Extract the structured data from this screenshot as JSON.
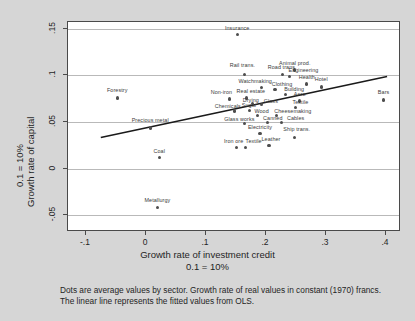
{
  "figure": {
    "background_color": "#d6d6d6",
    "plot_background_color": "#ffffff",
    "axis_color": "#4a4a4a",
    "grid_color": "#b9b9b9",
    "dot_color": "#4d4d4d",
    "fit_line_color": "#1a1a1a"
  },
  "caption": {
    "line1": "Dots are average values by sector. Growth rate of real values in constant (1970) francs.",
    "line2": "The linear line represents the fitted values from OLS."
  },
  "chart_data": {
    "type": "scatter",
    "title": "",
    "xlabel": "Growth rate of investment credit",
    "xlabel_sub": "0.1 = 10%",
    "ylabel": "Growth rate of capital",
    "ylabel_sub": "0.1 = 10%",
    "xlim": [
      -0.13,
      0.425
    ],
    "ylim": [
      -0.068,
      0.157
    ],
    "grid": true,
    "legend": "none",
    "xticks": [
      -0.1,
      0,
      0.1,
      0.2,
      0.3,
      0.4
    ],
    "xtick_labels": [
      "-.1",
      "0",
      ".1",
      ".2",
      ".3",
      ".4"
    ],
    "yticks": [
      -0.05,
      0,
      0.05,
      0.1,
      0.15
    ],
    "ytick_labels": [
      "-.05",
      "0",
      ".05",
      ".1",
      ".15"
    ],
    "fit_line": {
      "label": "OLS fitted values",
      "x_start": -0.075,
      "y_start": 0.032,
      "x_end": 0.405,
      "y_end": 0.098
    },
    "points": [
      {
        "label": "Insurance",
        "x": 0.152,
        "y": 0.1435,
        "label_dx": 0,
        "label_dy": -6
      },
      {
        "label": "Animal prod.",
        "x": 0.248,
        "y": 0.1055,
        "label_dx": 0,
        "label_dy": -6
      },
      {
        "label": "Rail trans.",
        "x": 0.164,
        "y": 0.1005,
        "label_dx": -2,
        "label_dy": -9
      },
      {
        "label": "Road trans.",
        "x": 0.227,
        "y": 0.1005,
        "label_dx": 0,
        "label_dy": -7
      },
      {
        "label": "Engineering",
        "x": 0.239,
        "y": 0.0985,
        "label_dx": 14,
        "label_dy": -6
      },
      {
        "label": "Health",
        "x": 0.268,
        "y": 0.0905,
        "label_dx": 0,
        "label_dy": -6
      },
      {
        "label": "Hotel",
        "x": 0.292,
        "y": 0.0875,
        "label_dx": 0,
        "label_dy": -7
      },
      {
        "label": "Watchmaking",
        "x": 0.192,
        "y": 0.0865,
        "label_dx": -6,
        "label_dy": -6
      },
      {
        "label": "Clothing",
        "x": 0.215,
        "y": 0.0845,
        "label_dx": 7,
        "label_dy": -5
      },
      {
        "label": "Building",
        "x": 0.232,
        "y": 0.0795,
        "label_dx": 9,
        "label_dy": -4
      },
      {
        "label": "Forestry",
        "x": -0.048,
        "y": 0.0755,
        "label_dx": 0,
        "label_dy": -7
      },
      {
        "label": "Non-iron",
        "x": 0.139,
        "y": 0.0745,
        "label_dx": -8,
        "label_dy": -6
      },
      {
        "label": "Real estate",
        "x": 0.168,
        "y": 0.0755,
        "label_dx": 4,
        "label_dy": -6
      },
      {
        "label": "Bars",
        "x": 0.396,
        "y": 0.0735,
        "label_dx": 0,
        "label_dy": -7
      },
      {
        "label": "Aero",
        "x": 0.256,
        "y": 0.0725,
        "label_dx": 0,
        "label_dy": -6
      },
      {
        "label": "Drying",
        "x": 0.178,
        "y": 0.0695,
        "label_dx": -2,
        "label_dy": -3
      },
      {
        "label": "Glass",
        "x": 0.193,
        "y": 0.0685,
        "label_dx": 9,
        "label_dy": -3
      },
      {
        "label": "Textile",
        "x": 0.249,
        "y": 0.0655,
        "label_dx": 5,
        "label_dy": -4
      },
      {
        "label": "Chemicals",
        "x": 0.148,
        "y": 0.0615,
        "label_dx": -7,
        "label_dy": -4
      },
      {
        "label": "Sugar",
        "x": 0.172,
        "y": 0.0625,
        "label_dx": 0,
        "label_dy": -4
      },
      {
        "label": "Wood",
        "x": 0.186,
        "y": 0.0565,
        "label_dx": 4,
        "label_dy": -4
      },
      {
        "label": "Cheesemaking",
        "x": 0.218,
        "y": 0.0565,
        "label_dx": 16,
        "label_dy": -4
      },
      {
        "label": "Precious metal",
        "x": 0.007,
        "y": 0.0435,
        "label_dx": 0,
        "label_dy": -7
      },
      {
        "label": "Glass works",
        "x": 0.164,
        "y": 0.0485,
        "label_dx": -5,
        "label_dy": -3
      },
      {
        "label": "Canned",
        "x": 0.203,
        "y": 0.0495,
        "label_dx": 5,
        "label_dy": -3
      },
      {
        "label": "Cables",
        "x": 0.226,
        "y": 0.0495,
        "label_dx": 14,
        "label_dy": -3
      },
      {
        "label": "Electricity",
        "x": 0.19,
        "y": 0.0375,
        "label_dx": 0,
        "label_dy": -6
      },
      {
        "label": "Ship trans.",
        "x": 0.248,
        "y": 0.0335,
        "label_dx": 2,
        "label_dy": -7
      },
      {
        "label": "Leather",
        "x": 0.205,
        "y": 0.0245,
        "label_dx": 2,
        "label_dy": -6
      },
      {
        "label": "Iron ore",
        "x": 0.151,
        "y": 0.0225,
        "label_dx": -3,
        "label_dy": -6
      },
      {
        "label": "Textile",
        "x": 0.166,
        "y": 0.0225,
        "label_dx": 8,
        "label_dy": -6
      },
      {
        "label": "Coal",
        "x": 0.022,
        "y": 0.0115,
        "label_dx": 0,
        "label_dy": -6
      },
      {
        "label": "Metallurgy",
        "x": 0.019,
        "y": -0.0415,
        "label_dx": 0,
        "label_dy": -6
      }
    ]
  }
}
